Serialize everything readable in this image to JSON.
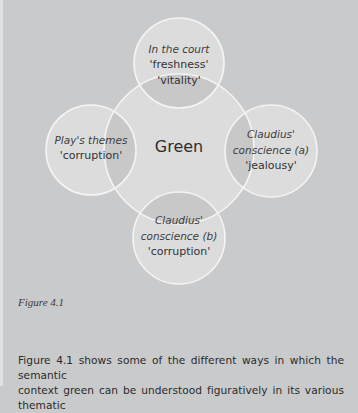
{
  "diagram": {
    "center": {
      "label": "Green"
    },
    "nodes": [
      {
        "id": "top",
        "category": "In the court",
        "senses": [
          "'freshness'",
          "'vitality'"
        ]
      },
      {
        "id": "left",
        "category": "Play's themes",
        "senses": [
          "'corruption'"
        ]
      },
      {
        "id": "right",
        "category_lines": [
          "Claudius'",
          "conscience (a)"
        ],
        "senses": [
          "'jealousy'"
        ]
      },
      {
        "id": "bottom",
        "category_lines": [
          "Claudius'",
          "conscience (b)"
        ],
        "senses": [
          "'corruption'"
        ]
      }
    ],
    "colors": {
      "background": "#c9cacb",
      "circle_fill": "#dcdcdc",
      "overlap_fill": "#c6c6c6",
      "stroke": "#f4f4f4"
    }
  },
  "caption": "Figure 4.1",
  "body_text": {
    "lines": [
      "Figure 4.1 shows some of the different ways in which the semantic",
      "context green can be understood figuratively in its various thematic"
    ]
  }
}
